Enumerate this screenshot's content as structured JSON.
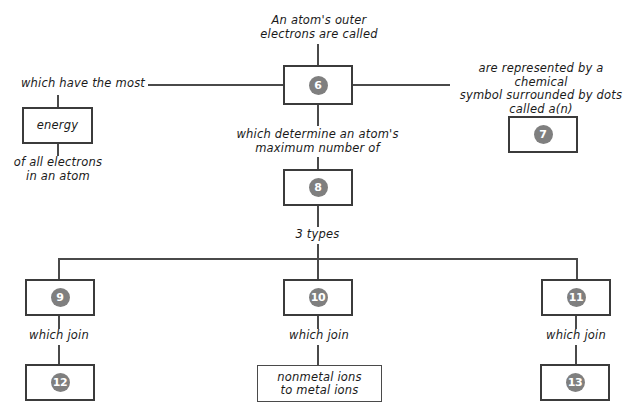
{
  "diagram": {
    "title_label": "An atom's outer\nelectrons are called",
    "left_branch_label": "which have the most",
    "left_box_text": "energy",
    "left_footer_label": "of all electrons\nin an atom",
    "right_branch_label": "are represented by a chemical\nsymbol surrounded by dots\ncalled a(n)",
    "middle_label": "which determine an atom's\nmaximum number of",
    "types_label": "3 types",
    "join_label_left": "which join",
    "join_label_middle": "which join",
    "join_label_right": "which join",
    "middle_bottom_box_text": "nonmetal ions\nto metal ions",
    "blanks": {
      "b6": "6",
      "b7": "7",
      "b8": "8",
      "b9": "9",
      "b10": "10",
      "b11": "11",
      "b12": "12",
      "b13": "13"
    },
    "colors": {
      "line": "#4a4a4a",
      "box_border": "#3b3b3b",
      "circle_fill": "#7f7f7f",
      "circle_text": "#ffffff",
      "text": "#1a1a1a",
      "background": "#ffffff"
    }
  }
}
